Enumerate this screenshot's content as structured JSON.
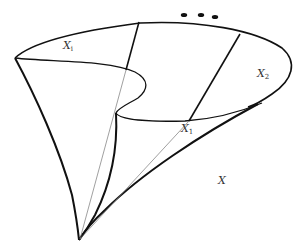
{
  "figure": {
    "labels": {
      "xi": {
        "base": "X",
        "sub": "i"
      },
      "x1": {
        "base": "X",
        "sub": "1"
      },
      "x2": {
        "base": "X",
        "sub": "2"
      },
      "x": {
        "base": "X",
        "sub": ""
      }
    },
    "ellipsis": "...",
    "colors": {
      "stroke": "#111111",
      "thin_stroke": "#777777",
      "text": "#333333",
      "background": "#ffffff"
    }
  }
}
